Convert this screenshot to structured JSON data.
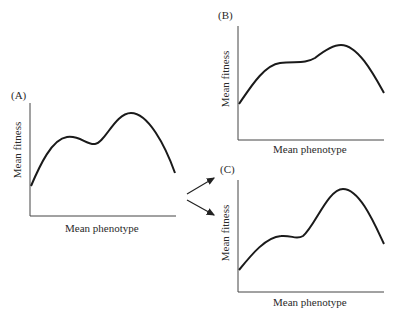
{
  "panels": [
    {
      "id": "A",
      "label": "(A)",
      "ylabel": "Mean fitness",
      "xlabel": "Mean phenotype",
      "curve_description": "Two peaks: smaller local peak, dip, then higher global peak, declining at right"
    },
    {
      "id": "B",
      "label": "(B)",
      "ylabel": "Mean fitness",
      "xlabel": "Mean phenotype",
      "curve_description": "Lower peak flattened into a plateau; single global peak remains"
    },
    {
      "id": "C",
      "label": "(C)",
      "ylabel": "Mean fitness",
      "xlabel": "Mean phenotype",
      "curve_description": "Shoulder/plateau then taller, sharper global peak"
    }
  ],
  "arrows": [
    {
      "from": "A",
      "to": "B"
    },
    {
      "from": "A",
      "to": "C"
    }
  ],
  "colors": {
    "line": "#1a1a1a",
    "axis": "#333333",
    "background": "#ffffff"
  }
}
